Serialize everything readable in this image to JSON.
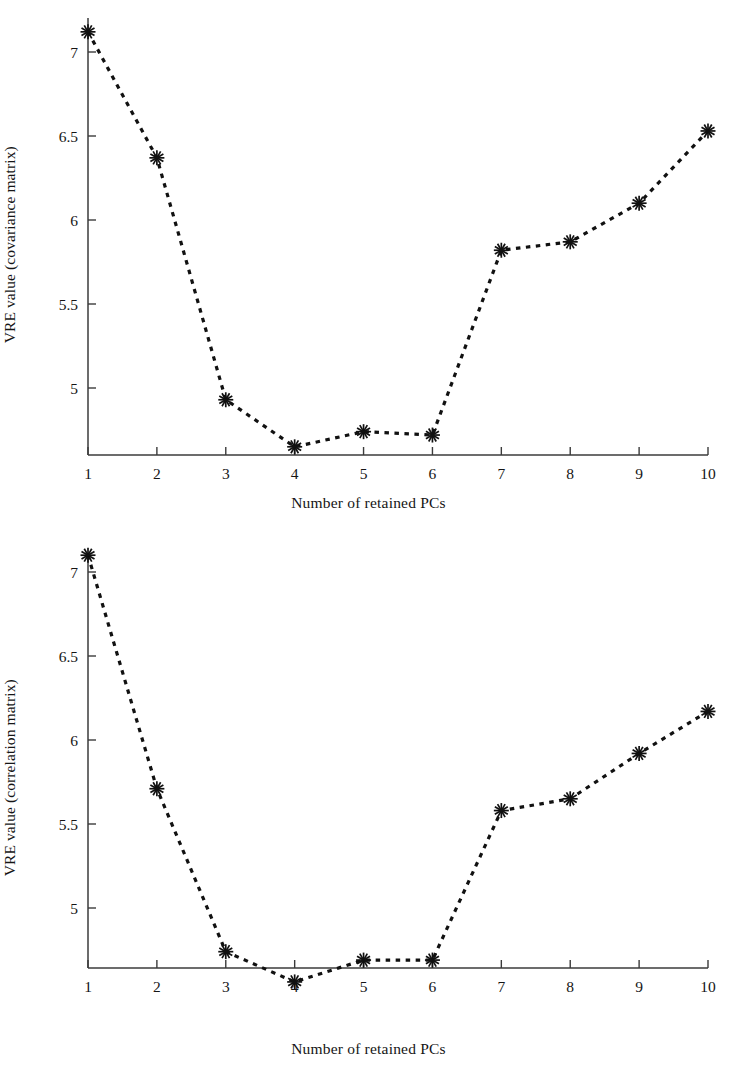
{
  "figure": {
    "background": "#ffffff",
    "line_color": "#111111",
    "axis_color": "#3b3b3b",
    "marker_symbol": "asterisk"
  },
  "panels": [
    {
      "id": "covariance-panel",
      "ylabel": "VRE value (covariance matrix)",
      "xlabel": "Number of retained PCs",
      "ytick_labels": [
        "5",
        "5.5",
        "6",
        "6.5",
        "7"
      ],
      "xtick_labels": [
        "1",
        "2",
        "3",
        "4",
        "5",
        "6",
        "7",
        "8",
        "9",
        "10"
      ]
    },
    {
      "id": "correlation-panel",
      "ylabel": "VRE value (correlation matrix)",
      "xlabel": "Number of retained PCs",
      "ytick_labels": [
        "5",
        "5.5",
        "6",
        "6.5",
        "7"
      ],
      "xtick_labels": [
        "1",
        "2",
        "3",
        "4",
        "5",
        "6",
        "7",
        "8",
        "9",
        "10"
      ]
    }
  ],
  "chart_data": [
    {
      "type": "line",
      "id": "covariance-panel",
      "title": "",
      "xlabel": "Number of retained PCs",
      "ylabel": "VRE value (covariance matrix)",
      "x": [
        1,
        2,
        3,
        4,
        5,
        6,
        7,
        8,
        9,
        10
      ],
      "values": [
        7.12,
        6.37,
        4.93,
        4.65,
        4.74,
        4.72,
        5.82,
        5.87,
        6.1,
        6.53
      ],
      "xtick_labels": [
        "1",
        "2",
        "3",
        "4",
        "5",
        "6",
        "7",
        "8",
        "9",
        "10"
      ],
      "ytick_values": [
        5,
        5.5,
        6,
        6.5,
        7
      ],
      "ytick_labels": [
        "5",
        "5.5",
        "6",
        "6.5",
        "7"
      ],
      "xlim": [
        1,
        10
      ],
      "ylim": [
        4.65,
        7.24
      ],
      "grid": false,
      "legend": "none",
      "linestyle": "dashed",
      "marker": "asterisk"
    },
    {
      "type": "line",
      "id": "correlation-panel",
      "title": "",
      "xlabel": "Number of retained PCs",
      "ylabel": "VRE value (correlation matrix)",
      "x": [
        1,
        2,
        3,
        4,
        5,
        6,
        7,
        8,
        9,
        10
      ],
      "values": [
        7.1,
        5.71,
        4.74,
        4.56,
        4.69,
        4.69,
        5.58,
        5.65,
        5.92,
        6.17
      ],
      "xtick_labels": [
        "1",
        "2",
        "3",
        "4",
        "5",
        "6",
        "7",
        "8",
        "9",
        "10"
      ],
      "ytick_values": [
        5,
        5.5,
        6,
        6.5,
        7
      ],
      "ytick_labels": [
        "5",
        "5.5",
        "6",
        "6.5",
        "7"
      ],
      "xlim": [
        1,
        10
      ],
      "ylim": [
        4.56,
        7.18
      ],
      "grid": false,
      "legend": "none",
      "linestyle": "dashed",
      "marker": "asterisk"
    }
  ]
}
